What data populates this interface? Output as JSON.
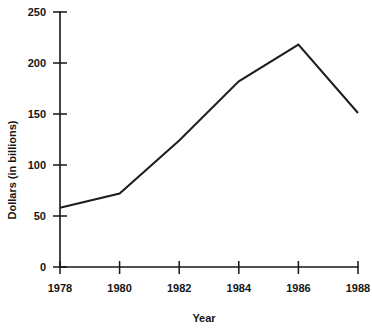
{
  "chart_data": {
    "type": "line",
    "title": "",
    "subtitle": "",
    "xlabel": "Year",
    "ylabel": "Dollars (in billions)",
    "x": [
      1978,
      1980,
      1982,
      1984,
      1986,
      1988
    ],
    "categories": [
      "1978",
      "1980",
      "1982",
      "1984",
      "1986",
      "1988"
    ],
    "values": [
      58,
      72,
      124,
      182,
      218,
      151
    ],
    "series": [
      {
        "name": "Dollars (in billions)",
        "values": [
          58,
          72,
          124,
          182,
          218,
          151
        ]
      }
    ],
    "xlim": [
      1978,
      1988
    ],
    "ylim": [
      0,
      250
    ],
    "ytick_values": [
      0,
      50,
      100,
      150,
      200,
      250
    ],
    "ytick_labels": [
      "0",
      "50",
      "100",
      "150",
      "200",
      "250"
    ],
    "xtick_values": [
      1978,
      1980,
      1982,
      1984,
      1986,
      1988
    ],
    "xtick_labels": [
      "1978",
      "1980",
      "1982",
      "1984",
      "1986",
      "1988"
    ],
    "grid": false,
    "legend": false,
    "legend_position": "none",
    "line_color": "#1d1d1d",
    "background_color": "#ffffff",
    "axis_color": "#161616",
    "annotations": []
  },
  "labels": {
    "y_axis_title": "Dollars (in billions)",
    "x_axis_title": "Year",
    "y_ticks": [
      "250",
      "200",
      "150",
      "100",
      "50",
      "0"
    ],
    "x_ticks": [
      "1978",
      "1980",
      "1982",
      "1984",
      "1986",
      "1988"
    ]
  }
}
